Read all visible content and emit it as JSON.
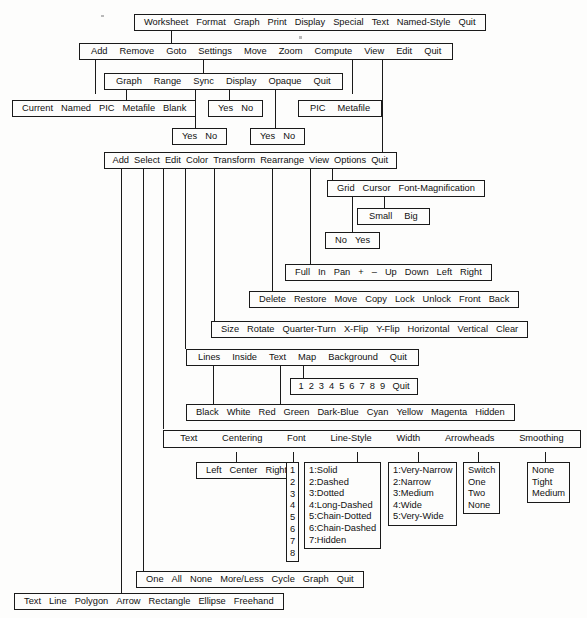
{
  "diagram": {
    "background": "#fdfdfc",
    "line_color": "#1a1a1a"
  },
  "menus": {
    "main": [
      "Worksheet",
      "Format",
      "Graph",
      "Print",
      "Display",
      "Special",
      "Text",
      "Named-Style",
      "Quit"
    ],
    "graph": [
      "Add",
      "Remove",
      "Goto",
      "Settings",
      "Move",
      "Zoom",
      "Compute",
      "View",
      "Edit",
      "Quit"
    ],
    "settings": [
      "Graph",
      "Range",
      "Sync",
      "Display",
      "Opaque",
      "Quit"
    ],
    "add_source": [
      "Current",
      "Named",
      "PIC",
      "Metafile",
      "Blank"
    ],
    "settings_display_yesno": [
      "Yes",
      "No"
    ],
    "view_format": [
      "PIC",
      "Metafile"
    ],
    "sync_yesno": [
      "Yes",
      "No"
    ],
    "opaque_yesno": [
      "Yes",
      "No"
    ],
    "edit": [
      "Add",
      "Select",
      "Edit",
      "Color",
      "Transform",
      "Rearrange",
      "View",
      "Options",
      "Quit"
    ],
    "options": [
      "Grid",
      "Cursor",
      "Font-Magnification"
    ],
    "font_magnification": [
      "Small",
      "Big"
    ],
    "cursor_noyes": [
      "No",
      "Yes"
    ],
    "view_pan": [
      "Full",
      "In",
      "Pan",
      "+",
      "–",
      "Up",
      "Down",
      "Left",
      "Right"
    ],
    "rearrange": [
      "Delete",
      "Restore",
      "Move",
      "Copy",
      "Lock",
      "Unlock",
      "Front",
      "Back"
    ],
    "transform": [
      "Size",
      "Rotate",
      "Quarter-Turn",
      "X-Flip",
      "Y-Flip",
      "Horizontal",
      "Vertical",
      "Clear"
    ],
    "color": [
      "Lines",
      "Inside",
      "Text",
      "Map",
      "Background",
      "Quit"
    ],
    "map_numbers": [
      "1",
      "2",
      "3",
      "4",
      "5",
      "6",
      "7",
      "8",
      "9",
      "Quit"
    ],
    "palette": [
      "Black",
      "White",
      "Red",
      "Green",
      "Dark-Blue",
      "Cyan",
      "Yellow",
      "Magenta",
      "Hidden"
    ],
    "edit_attributes": [
      "Text",
      "Centering",
      "Font",
      "Line-Style",
      "Width",
      "Arrowheads",
      "Smoothing"
    ],
    "centering": [
      "Left",
      "Center",
      "Right"
    ],
    "font_numbers": [
      "1",
      "2",
      "3",
      "4",
      "5",
      "6",
      "7",
      "8"
    ],
    "line_style": [
      "1:Solid",
      "2:Dashed",
      "3:Dotted",
      "4:Long-Dashed",
      "5:Chain-Dotted",
      "6:Chain-Dashed",
      "7:Hidden"
    ],
    "width": [
      "1:Very-Narrow",
      "2:Narrow",
      "3:Medium",
      "4:Wide",
      "5:Very-Wide"
    ],
    "arrowheads": [
      "Switch",
      "One",
      "Two",
      "None"
    ],
    "smoothing": [
      "None",
      "Tight",
      "Medium"
    ],
    "select": [
      "One",
      "All",
      "None",
      "More/Less",
      "Cycle",
      "Graph",
      "Quit"
    ],
    "add_objects": [
      "Text",
      "Line",
      "Polygon",
      "Arrow",
      "Rectangle",
      "Ellipse",
      "Freehand"
    ]
  }
}
